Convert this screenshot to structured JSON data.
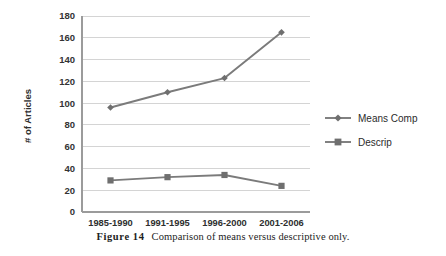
{
  "figure": {
    "number_label": "Figure 14",
    "caption_text": "Comparison of means versus descriptive only."
  },
  "chart_data": {
    "type": "line",
    "title": "",
    "xlabel": "",
    "ylabel": "# of Articles",
    "categories": [
      "1985-1990",
      "1991-1995",
      "1996-2000",
      "2001-2006"
    ],
    "series": [
      {
        "name": "Means Comp",
        "marker": "diamond",
        "color": "#7b7b7b",
        "values": [
          96,
          110,
          123,
          165
        ]
      },
      {
        "name": "Descrip",
        "marker": "square",
        "color": "#7b7b7b",
        "values": [
          29,
          32,
          34,
          24
        ]
      }
    ],
    "ylim": [
      0,
      180
    ],
    "ytick_step": 20,
    "yticks": [
      "0",
      "20",
      "40",
      "60",
      "80",
      "100",
      "120",
      "140",
      "160",
      "180"
    ],
    "grid": "horizontal",
    "legend_position": "right",
    "legend_entries": [
      "Means Comp",
      "Descrip"
    ]
  },
  "colors": {
    "series": "#7b7b7b",
    "gridline": "#d4d4d4",
    "axis": "#9b9b9b",
    "text": "#2e2e2e",
    "background": "#ffffff"
  }
}
